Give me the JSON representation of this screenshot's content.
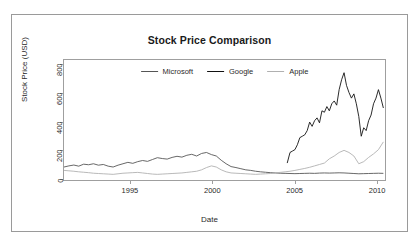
{
  "figure": {
    "title": "Stock Price Comparison",
    "xlabel": "Date",
    "ylabel": "Stock Price (USD)"
  },
  "legend": {
    "position": "top-center-inside",
    "entries": [
      {
        "label": "Microsoft",
        "color": "#555555"
      },
      {
        "label": "Google",
        "color": "#111111"
      },
      {
        "label": "Apple",
        "color": "#b0b0b0"
      }
    ]
  },
  "axes": {
    "x_ticks": [
      "1995",
      "2000",
      "2005",
      "2010"
    ],
    "x_tick_values": [
      1995,
      2000,
      2005,
      2010
    ],
    "y_ticks": [
      "0",
      "200",
      "400",
      "600",
      "800"
    ],
    "y_tick_values": [
      0,
      200,
      400,
      600,
      800
    ]
  },
  "chart_data": {
    "type": "line",
    "title": "Stock Price Comparison",
    "xlabel": "Date",
    "ylabel": "Stock Price (USD)",
    "xlim": [
      1991.0,
      2010.6
    ],
    "ylim": [
      -20,
      830
    ],
    "grid": false,
    "legend_position": "top-center",
    "xticks": [
      1995,
      2000,
      2005,
      2010
    ],
    "yticks": [
      0,
      200,
      400,
      600,
      800
    ],
    "series": [
      {
        "name": "Microsoft",
        "color": "#555555",
        "x": [
          1991.0,
          1991.3,
          1991.6,
          1991.9,
          1992.2,
          1992.5,
          1992.8,
          1993.1,
          1993.4,
          1993.7,
          1994.0,
          1994.3,
          1994.6,
          1994.9,
          1995.2,
          1995.5,
          1995.8,
          1996.1,
          1996.4,
          1996.7,
          1997.0,
          1997.3,
          1997.6,
          1997.9,
          1998.2,
          1998.5,
          1998.8,
          1999.1,
          1999.4,
          1999.7,
          2000.0,
          2000.3,
          2000.6,
          2000.9,
          2001.2,
          2001.5,
          2001.8,
          2002.1,
          2002.4,
          2002.7,
          2003.0,
          2003.3,
          2003.6,
          2003.9,
          2004.2,
          2004.5,
          2004.8,
          2005.1,
          2005.4,
          2005.7,
          2006.0,
          2006.3,
          2006.6,
          2006.9,
          2007.2,
          2007.5,
          2007.8,
          2008.1,
          2008.4,
          2008.7,
          2009.0,
          2009.3,
          2009.6,
          2009.9,
          2010.2,
          2010.5
        ],
        "y": [
          72,
          80,
          86,
          78,
          92,
          88,
          95,
          85,
          90,
          78,
          72,
          85,
          95,
          105,
          98,
          110,
          118,
          112,
          125,
          138,
          132,
          128,
          140,
          148,
          142,
          155,
          162,
          150,
          168,
          175,
          160,
          150,
          120,
          95,
          75,
          68,
          60,
          52,
          48,
          42,
          38,
          35,
          32,
          30,
          28,
          27,
          26,
          25,
          26,
          27,
          28,
          27,
          29,
          30,
          29,
          30,
          31,
          30,
          28,
          26,
          24,
          25,
          26,
          27,
          28,
          27
        ]
      },
      {
        "name": "Google",
        "color": "#111111",
        "x": [
          2004.63,
          2004.8,
          2004.95,
          2005.1,
          2005.25,
          2005.4,
          2005.55,
          2005.7,
          2005.85,
          2006.0,
          2006.15,
          2006.3,
          2006.45,
          2006.6,
          2006.75,
          2006.9,
          2007.05,
          2007.2,
          2007.35,
          2007.5,
          2007.65,
          2007.8,
          2007.95,
          2008.1,
          2008.25,
          2008.4,
          2008.55,
          2008.7,
          2008.85,
          2009.0,
          2009.15,
          2009.3,
          2009.45,
          2009.6,
          2009.75,
          2009.9,
          2010.05,
          2010.2,
          2010.35,
          2010.5
        ],
        "y": [
          100,
          175,
          185,
          195,
          230,
          280,
          290,
          300,
          330,
          390,
          360,
          400,
          420,
          385,
          470,
          460,
          500,
          470,
          520,
          540,
          510,
          620,
          690,
          740,
          650,
          600,
          560,
          590,
          520,
          430,
          290,
          350,
          330,
          400,
          440,
          520,
          560,
          620,
          560,
          490
        ]
      },
      {
        "name": "Apple",
        "color": "#b0b0b0",
        "x": [
          1991.0,
          1991.3,
          1991.6,
          1991.9,
          1992.2,
          1992.5,
          1992.8,
          1993.1,
          1993.4,
          1993.7,
          1994.0,
          1994.3,
          1994.6,
          1994.9,
          1995.2,
          1995.5,
          1995.8,
          1996.1,
          1996.4,
          1996.7,
          1997.0,
          1997.3,
          1997.6,
          1997.9,
          1998.2,
          1998.5,
          1998.8,
          1999.1,
          1999.4,
          1999.7,
          2000.0,
          2000.3,
          2000.6,
          2000.9,
          2001.2,
          2001.5,
          2001.8,
          2002.1,
          2002.4,
          2002.7,
          2003.0,
          2003.3,
          2003.6,
          2003.9,
          2004.2,
          2004.5,
          2004.8,
          2005.1,
          2005.4,
          2005.7,
          2006.0,
          2006.3,
          2006.6,
          2006.9,
          2007.2,
          2007.5,
          2007.8,
          2008.1,
          2008.4,
          2008.7,
          2009.0,
          2009.3,
          2009.6,
          2009.9,
          2010.2,
          2010.5
        ],
        "y": [
          48,
          45,
          42,
          38,
          35,
          32,
          28,
          26,
          24,
          22,
          20,
          24,
          28,
          30,
          32,
          34,
          30,
          26,
          22,
          20,
          22,
          24,
          26,
          28,
          30,
          34,
          38,
          42,
          52,
          68,
          80,
          72,
          52,
          38,
          30,
          28,
          26,
          24,
          22,
          20,
          22,
          24,
          26,
          30,
          34,
          38,
          42,
          48,
          55,
          62,
          70,
          80,
          90,
          100,
          130,
          150,
          175,
          190,
          175,
          150,
          95,
          110,
          140,
          165,
          195,
          250
        ]
      }
    ]
  }
}
